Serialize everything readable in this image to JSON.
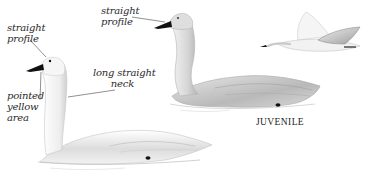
{
  "illustration": {
    "subjects": [
      {
        "id": "adult-swimming",
        "description": "adult swan swimming, neck held straight"
      },
      {
        "id": "juvenile-swimming",
        "description": "juvenile swan swimming, grayish plumage"
      },
      {
        "id": "juvenile-flying",
        "description": "swan in flight"
      }
    ],
    "annotations": {
      "adult_profile": "straight\nprofile",
      "adult_bill": "pointed\nyellow\narea",
      "adult_neck": "long straight\n      neck",
      "juvenile_profile": "straight\nprofile"
    },
    "caption": "JUVENILE",
    "colors": {
      "bill": "#111111",
      "plumage_light": "#f4f4f4",
      "plumage_shade": "#bdbdbd",
      "juvenile_shade": "#a9a9a9",
      "leader_line": "#444444",
      "text": "#2a2a2a"
    }
  }
}
